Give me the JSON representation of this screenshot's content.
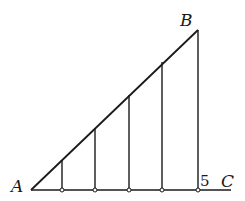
{
  "diagram": {
    "type": "geometry-figure",
    "colors": {
      "stroke": "#1a1a1a",
      "background": "#ffffff"
    },
    "points": {
      "A": {
        "label": "A",
        "x": 31,
        "y": 190
      },
      "B": {
        "label": "B",
        "x": 198,
        "y": 30
      },
      "C": {
        "label": "C",
        "x": 230,
        "y": 190
      }
    },
    "base_line": {
      "x1": 31,
      "y1": 190,
      "x2": 231,
      "y2": 190
    },
    "hypotenuse": {
      "x1": 31,
      "y1": 190,
      "x2": 198,
      "y2": 30
    },
    "verticals": [
      {
        "x": 62,
        "top": 160,
        "bottom": 190
      },
      {
        "x": 95,
        "top": 128,
        "bottom": 190
      },
      {
        "x": 129,
        "top": 95,
        "bottom": 190
      },
      {
        "x": 162,
        "top": 62,
        "bottom": 190
      },
      {
        "x": 198,
        "top": 30,
        "bottom": 190
      }
    ],
    "labels": {
      "A": "A",
      "B": "B",
      "C": "C",
      "five": "5"
    }
  }
}
